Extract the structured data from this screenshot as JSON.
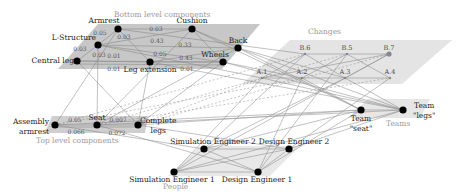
{
  "layers": {
    "bottom": {
      "label": "Bottom level components",
      "color": "#bdbdbd"
    },
    "changes": {
      "label": "Changes",
      "color": "#e2e2e2"
    },
    "top": {
      "label": "Top level components",
      "color": "#cfcfcf"
    },
    "teams": {
      "label": "Teams",
      "color": "#e6e6e6"
    },
    "people": {
      "label": "People",
      "color": "#e3e3e3"
    }
  },
  "nodes": {
    "armrest": {
      "label": "Armrest",
      "x": 118,
      "y": 29
    },
    "cushion": {
      "label": "Cushion",
      "x": 192,
      "y": 29
    },
    "l_structure": {
      "label": "L-Structure",
      "x": 98,
      "y": 45
    },
    "back": {
      "label": "Back",
      "x": 238,
      "y": 48
    },
    "central_leg": {
      "label": "Central leg",
      "x": 77,
      "y": 61
    },
    "leg_extension": {
      "label": "Leg extension",
      "x": 150,
      "y": 62
    },
    "wheels": {
      "label": "Wheels",
      "x": 223,
      "y": 62
    },
    "b6": {
      "label": "B.6",
      "x": 305,
      "y": 54
    },
    "b5": {
      "label": "B.5",
      "x": 347,
      "y": 54
    },
    "b7": {
      "label": "B.7",
      "x": 389,
      "y": 54
    },
    "a1": {
      "label": "A.1",
      "x": 262,
      "y": 78
    },
    "a2": {
      "label": "A.2",
      "x": 302,
      "y": 78
    },
    "a3": {
      "label": "A.3",
      "x": 345,
      "y": 78
    },
    "a4": {
      "label": "A.4",
      "x": 390,
      "y": 78
    },
    "assembly_armrest": {
      "label": "Assembly\narmrest",
      "x": 55,
      "y": 125
    },
    "seat": {
      "label": "Seat",
      "x": 97,
      "y": 125
    },
    "complete_legs": {
      "label": "Complete\nlegs",
      "x": 138,
      "y": 125
    },
    "team_seat": {
      "label": "Team\n\"seat\"",
      "x": 361,
      "y": 110
    },
    "team_legs": {
      "label": "Team\n\"legs\"",
      "x": 403,
      "y": 110
    },
    "sim_eng_2": {
      "label": "Simulation Engineer 2",
      "x": 204,
      "y": 149
    },
    "des_eng_2": {
      "label": "Design Engineer 2",
      "x": 289,
      "y": 149
    },
    "sim_eng_1": {
      "label": "Simulation Engineer 1",
      "x": 174,
      "y": 172
    },
    "des_eng_1": {
      "label": "Design Engineer 1",
      "x": 258,
      "y": 172
    }
  },
  "edge_labels": [
    {
      "text": "0.05",
      "x": 100,
      "y": 30
    },
    {
      "text": "0.03",
      "x": 124,
      "y": 33
    },
    {
      "text": "0.03",
      "x": 156,
      "y": 27
    },
    {
      "text": "0.43",
      "x": 157,
      "y": 38
    },
    {
      "text": "0.33",
      "x": 185,
      "y": 42
    },
    {
      "text": "0.03",
      "x": 80,
      "y": 46
    },
    {
      "text": "0.03",
      "x": 99,
      "y": 52
    },
    {
      "text": "0.01",
      "x": 114,
      "y": 53
    },
    {
      "text": "0.05",
      "x": 160,
      "y": 51
    },
    {
      "text": "0.43",
      "x": 186,
      "y": 55
    },
    {
      "text": "0.01",
      "x": 114,
      "y": 67
    },
    {
      "text": "0.01",
      "x": 187,
      "y": 67
    },
    {
      "text": "0.05",
      "x": 75,
      "y": 118
    },
    {
      "text": "0.007",
      "x": 118,
      "y": 117
    },
    {
      "text": "0.066",
      "x": 76,
      "y": 130
    },
    {
      "text": "0.072",
      "x": 117,
      "y": 131
    }
  ]
}
